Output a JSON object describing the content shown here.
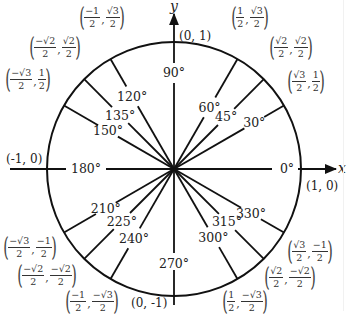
{
  "diagram": {
    "axes": {
      "x_label": "x",
      "y_label": "y"
    },
    "center": {
      "cx": 174,
      "cy": 169,
      "r": 127
    },
    "axis_points": [
      {
        "id": "p0",
        "label": "(1, 0)",
        "x": 306,
        "y": 186
      },
      {
        "id": "p90",
        "label": "(0, 1)",
        "x": 178,
        "y": 36
      },
      {
        "id": "p180",
        "label": "(-1, 0)",
        "x": 6,
        "y": 163
      },
      {
        "id": "p270",
        "label": "(0, -1)",
        "x": 132,
        "y": 308
      }
    ],
    "angles": [
      {
        "deg": 0,
        "label": "0°"
      },
      {
        "deg": 30,
        "label": "30°"
      },
      {
        "deg": 45,
        "label": "45°"
      },
      {
        "deg": 60,
        "label": "60°"
      },
      {
        "deg": 90,
        "label": "90°"
      },
      {
        "deg": 120,
        "label": "120°"
      },
      {
        "deg": 135,
        "label": "135°"
      },
      {
        "deg": 150,
        "label": "150°"
      },
      {
        "deg": 180,
        "label": "180°"
      },
      {
        "deg": 210,
        "label": "210°"
      },
      {
        "deg": 225,
        "label": "225°"
      },
      {
        "deg": 240,
        "label": "240°"
      },
      {
        "deg": 270,
        "label": "270°"
      },
      {
        "deg": 300,
        "label": "300°"
      },
      {
        "deg": 315,
        "label": "315°"
      },
      {
        "deg": 330,
        "label": "330°"
      }
    ],
    "coordinates": [
      {
        "deg": 30,
        "x_num": "√3",
        "x_den": "2",
        "y_num": "1",
        "y_den": "2"
      },
      {
        "deg": 45,
        "x_num": "√2",
        "x_den": "2",
        "y_num": "√2",
        "y_den": "2"
      },
      {
        "deg": 60,
        "x_num": "1",
        "x_den": "2",
        "y_num": "√3",
        "y_den": "2"
      },
      {
        "deg": 120,
        "x_num": "−1",
        "x_den": "2",
        "y_num": "√3",
        "y_den": "2"
      },
      {
        "deg": 135,
        "x_num": "−√2",
        "x_den": "2",
        "y_num": "√2",
        "y_den": "2"
      },
      {
        "deg": 150,
        "x_num": "−√3",
        "x_den": "2",
        "y_num": "1",
        "y_den": "2"
      },
      {
        "deg": 210,
        "x_num": "−√3",
        "x_den": "2",
        "y_num": "−1",
        "y_den": "2"
      },
      {
        "deg": 225,
        "x_num": "−√2",
        "x_den": "2",
        "y_num": "−√2",
        "y_den": "2"
      },
      {
        "deg": 240,
        "x_num": "−1",
        "x_den": "2",
        "y_num": "−√3",
        "y_den": "2"
      },
      {
        "deg": 300,
        "x_num": "1",
        "x_den": "2",
        "y_num": "−√3",
        "y_den": "2"
      },
      {
        "deg": 315,
        "x_num": "√2",
        "x_den": "2",
        "y_num": "−√2",
        "y_den": "2"
      },
      {
        "deg": 330,
        "x_num": "√3",
        "x_den": "2",
        "y_num": "−1",
        "y_den": "2"
      }
    ],
    "colors": {
      "stroke": "#111111",
      "text": "#222222",
      "background": "#ffffff"
    }
  }
}
